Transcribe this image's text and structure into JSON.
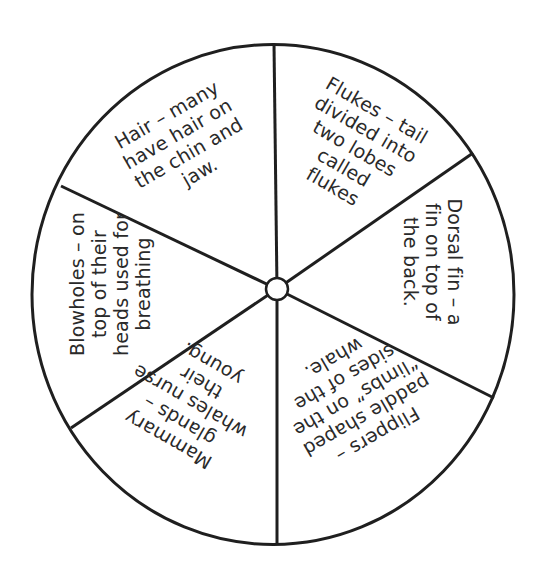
{
  "diagram": {
    "type": "wheel",
    "segment_count": 6,
    "stroke_color": "#1f1f1f",
    "fill_color": "#ffffff",
    "text_color": "#2a2a2a",
    "outer_circle": {
      "cx": 273,
      "cy": 294.5,
      "rx": 241,
      "ry": 250
    },
    "hub": {
      "cx": 277,
      "cy": 289,
      "r": 11
    },
    "spokes": [
      {
        "name": "spoke-top",
        "x2": 274,
        "y2": 44
      },
      {
        "name": "spoke-upper-right",
        "x2": 473,
        "y2": 153
      },
      {
        "name": "spoke-lower-right",
        "x2": 494,
        "y2": 398
      },
      {
        "name": "spoke-bottom",
        "x2": 277,
        "y2": 545
      },
      {
        "name": "spoke-lower-left",
        "x2": 71,
        "y2": 428
      },
      {
        "name": "spoke-upper-left",
        "x2": 61,
        "y2": 186
      }
    ],
    "segments": [
      {
        "name": "hair",
        "lines": [
          "Hair – many",
          "have hair on",
          "the chin and",
          "jaw."
        ],
        "center": [
          183,
          143
        ],
        "rotation": -30
      },
      {
        "name": "flukes",
        "lines": [
          "Flukes – tail",
          "divided into",
          "two lobes",
          "called",
          "flukes"
        ],
        "center": [
          355,
          148
        ],
        "rotation": 30
      },
      {
        "name": "dorsal-fin",
        "lines": [
          "Dorsal fin – a",
          "fin on top of",
          "the back."
        ],
        "center": [
          433,
          262
        ],
        "rotation": 90
      },
      {
        "name": "flippers",
        "lines": [
          "Flippers –",
          "paddle shaped",
          "“limbs” on the",
          "sides of the",
          "whale."
        ],
        "center": [
          356,
          397
        ],
        "rotation": 150
      },
      {
        "name": "mammary-glands",
        "lines": [
          "Mammary",
          "glands –",
          "whales nurse",
          "their",
          "young."
        ],
        "center": [
          190,
          402
        ],
        "rotation": -150
      },
      {
        "name": "blowholes",
        "lines": [
          "Blowholes – on",
          "top of their",
          "heads used for",
          "breathing"
        ],
        "center": [
          110,
          284
        ],
        "rotation": -90
      }
    ]
  }
}
